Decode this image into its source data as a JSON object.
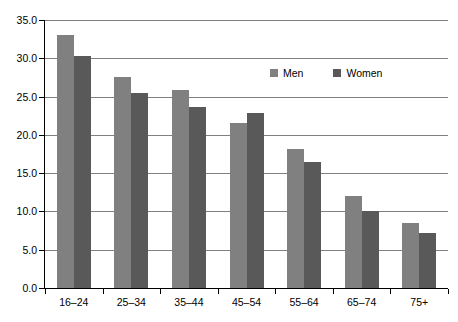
{
  "chart_data": {
    "type": "bar",
    "title": "",
    "subtitle": "",
    "xlabel": "",
    "ylabel": "",
    "categories": [
      "16–24",
      "25–34",
      "35–44",
      "45–54",
      "55–64",
      "65–74",
      "75+"
    ],
    "series": [
      {
        "name": "Men",
        "color": "#808080",
        "values": [
          33.0,
          27.6,
          25.8,
          21.6,
          18.2,
          12.0,
          8.5
        ]
      },
      {
        "name": "Women",
        "color": "#595959",
        "values": [
          30.3,
          25.5,
          23.7,
          22.8,
          16.4,
          10.1,
          7.2
        ]
      }
    ],
    "ylim": [
      0.0,
      35.0
    ],
    "yticks": [
      0.0,
      5.0,
      10.0,
      15.0,
      20.0,
      25.0,
      30.0,
      35.0
    ],
    "ytick_labels": [
      "0.0",
      "5.0",
      "10.0",
      "15.0",
      "20.0",
      "25.0",
      "30.0",
      "35.0"
    ],
    "grid": true,
    "grid_axis": "y",
    "legend": {
      "position": "upper-right-inside",
      "entries": [
        {
          "label": "Men",
          "color": "#808080"
        },
        {
          "label": "Women",
          "color": "#595959"
        }
      ]
    },
    "annotations": []
  }
}
